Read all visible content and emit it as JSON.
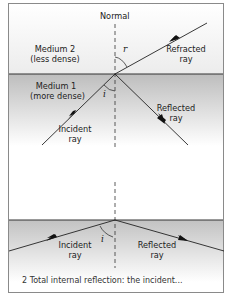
{
  "diagram_top": {
    "normal_label": "Normal",
    "medium2": {
      "name": "Medium 2",
      "desc": "(less dense)"
    },
    "medium1": {
      "name": "Medium 1",
      "desc": "(more dense)"
    },
    "refracted": {
      "line1": "Refracted",
      "line2": "ray"
    },
    "reflected": {
      "line1": "Reflected",
      "line2": "ray"
    },
    "incident": {
      "line1": "Incident",
      "line2": "ray"
    },
    "angle_r": "r",
    "angle_i": "i"
  },
  "diagram_bottom": {
    "incident": {
      "line1": "Incident",
      "line2": "ray"
    },
    "reflected": {
      "line1": "Reflected",
      "line2": "ray"
    },
    "angle_i": "i"
  },
  "caption": "2  Total internal reflection: the incident..."
}
